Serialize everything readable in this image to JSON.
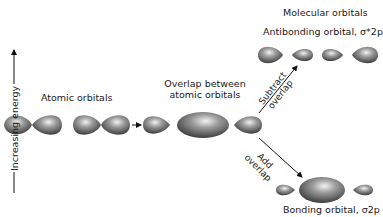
{
  "diagram": {
    "energy_axis": {
      "label": "Increasing energy",
      "direction": "up"
    },
    "atomic": {
      "label": "Atomic orbitals"
    },
    "overlap": {
      "label_line1": "Overlap between",
      "label_line2": "atomic orbitals"
    },
    "molecular": {
      "title": "Molecular orbitals",
      "antibonding": {
        "label": "Antibonding orbital, σ*2p"
      },
      "bonding": {
        "label": "Bonding orbital, σ2p"
      }
    },
    "paths": {
      "subtract": {
        "line1": "Subtract",
        "line2": "overlap"
      },
      "add": {
        "line1": "Add",
        "line2": "overlap"
      }
    },
    "colors": {
      "lobe_dark": "#2e2e2e",
      "lobe_mid": "#7a7a7a",
      "lobe_light": "#e8e8e8",
      "line": "#111111"
    }
  }
}
